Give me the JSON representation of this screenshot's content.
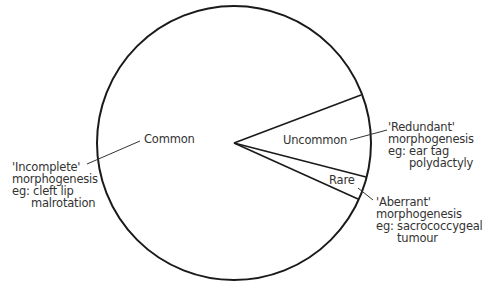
{
  "diagram": {
    "type": "pie-schematic",
    "segments": [
      {
        "key": "common",
        "label": "Common"
      },
      {
        "key": "uncommon",
        "label": "Uncommon"
      },
      {
        "key": "rare",
        "label": "Rare"
      }
    ],
    "annotations": {
      "incomplete": [
        "'Incomplete'",
        "morphogenesis",
        "eg: cleft lip",
        "malrotation"
      ],
      "redundant": [
        "'Redundant'",
        "morphogenesis",
        "eg: ear tag",
        "polydactyly"
      ],
      "aberrant": [
        "'Aberrant'",
        "morphogenesis",
        "eg: sacrococcygeal",
        "tumour"
      ]
    },
    "colors": {
      "stroke": "#1a1a1a",
      "text": "#333333",
      "background": "#ffffff"
    }
  }
}
